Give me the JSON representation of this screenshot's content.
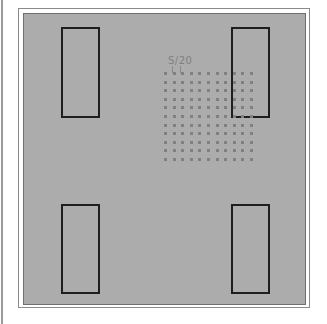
{
  "annotation": {
    "label": "S/20"
  },
  "grid": {
    "rows": 11,
    "columns": 11
  },
  "rectangles": [
    {
      "name": "top-left"
    },
    {
      "name": "top-right"
    },
    {
      "name": "bottom-left"
    },
    {
      "name": "bottom-right"
    }
  ],
  "colors": {
    "panel": "#acacac",
    "dot": "#808080",
    "rect_stroke": "#1e1e1e"
  }
}
